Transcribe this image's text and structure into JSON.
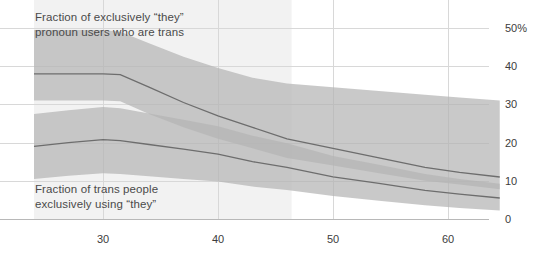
{
  "chart_data": {
    "type": "area",
    "title": "",
    "subtitle": "",
    "xlabel": "",
    "ylabel": "",
    "xlim": [
      24.0,
      64.5
    ],
    "ylim": [
      0,
      53
    ],
    "grid": true,
    "legend_position": "inline-annotation",
    "y_ticks": [
      0,
      10,
      20,
      30,
      40,
      50
    ],
    "y_tick_labels": [
      "0",
      "10",
      "20",
      "30",
      "40",
      "50%"
    ],
    "y_axis_side": "right",
    "x_ticks": [
      30,
      40,
      50,
      60
    ],
    "x_tick_labels": [
      "30",
      "40",
      "50",
      "60"
    ],
    "background_shading": {
      "label": "highlighted-x-region",
      "x_start": 24.0,
      "x_end": 46.4,
      "color": "#f2f2f2"
    },
    "series": [
      {
        "name": "Fraction of exclusively “they” pronoun users who are trans",
        "annotation": "Fraction of exclusively “they”\npronoun users who are trans",
        "color": "#b4b4b4",
        "line_color": "#6d6d6d",
        "x": [
          24.0,
          27.0,
          30.0,
          31.5,
          34.0,
          37.0,
          40.0,
          43.0,
          46.0,
          50.0,
          54.0,
          58.0,
          61.0,
          64.5
        ],
        "values": [
          38.0,
          38.0,
          38.0,
          37.8,
          34.5,
          30.5,
          27.0,
          24.0,
          21.0,
          18.5,
          16.0,
          13.5,
          12.2,
          11.0
        ],
        "lower": [
          31.0,
          31.0,
          31.0,
          30.8,
          27.5,
          24.0,
          21.0,
          18.5,
          16.0,
          14.0,
          12.0,
          10.0,
          9.0,
          7.8
        ],
        "upper": [
          49.5,
          49.5,
          49.5,
          49.0,
          46.0,
          42.5,
          39.5,
          37.0,
          35.5,
          34.5,
          33.5,
          32.5,
          31.8,
          31.0
        ]
      },
      {
        "name": "Fraction of trans people exclusively using “they”",
        "annotation": "Fraction of trans people\nexclusively using “they”",
        "color": "#b4b4b4",
        "line_color": "#6d6d6d",
        "x": [
          24.0,
          27.0,
          30.0,
          31.5,
          34.0,
          37.0,
          40.0,
          43.0,
          46.0,
          50.0,
          54.0,
          58.0,
          61.0,
          64.5
        ],
        "values": [
          19.0,
          20.0,
          20.8,
          20.5,
          19.5,
          18.3,
          17.0,
          15.0,
          13.5,
          11.0,
          9.3,
          7.5,
          6.5,
          5.5
        ],
        "lower": [
          10.5,
          11.3,
          12.0,
          11.8,
          11.2,
          10.5,
          9.8,
          8.5,
          7.6,
          6.0,
          4.8,
          3.6,
          2.9,
          2.2
        ],
        "upper": [
          27.5,
          28.5,
          29.3,
          29.0,
          27.6,
          26.0,
          24.3,
          21.8,
          19.8,
          16.5,
          14.2,
          11.8,
          10.5,
          9.2
        ]
      }
    ],
    "annotations": [
      {
        "id": "annot-upper",
        "text": "Fraction of exclusively “they”\npronoun users who are trans"
      },
      {
        "id": "annot-lower",
        "text": "Fraction of trans people\nexclusively using “they”"
      }
    ]
  },
  "axes": {
    "y_labels": [
      "50%",
      "40",
      "30",
      "20",
      "10",
      "0"
    ],
    "x_labels": [
      "30",
      "40",
      "50",
      "60"
    ]
  },
  "annotations": {
    "upper": "Fraction of exclusively “they”\npronoun users who are trans",
    "lower": "Fraction of trans people\nexclusively using “they”"
  },
  "colors": {
    "band": "#b4b4b4",
    "line": "#6d6d6d",
    "grid": "#d8d8d8",
    "panel": "#f2f2f2",
    "text": "#4a4a4a"
  }
}
